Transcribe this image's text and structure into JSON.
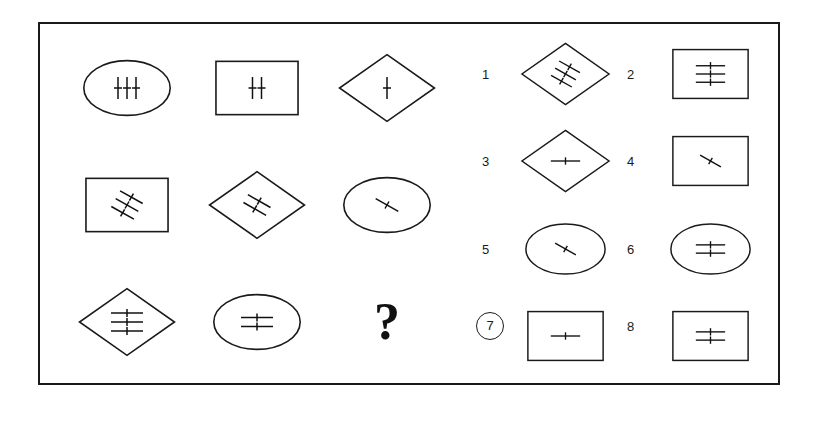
{
  "puzzle": {
    "title": "Matrix reasoning puzzle",
    "type": "3x3 matrix with 8 answer options",
    "question_mark": "?",
    "selected_option": "7",
    "frame_color": "#1a1a1a",
    "background_color": "#ffffff",
    "ink_color": "#111111"
  },
  "matrix": {
    "rows": 3,
    "cols": 3,
    "cells": [
      {
        "index": 1,
        "shape": "ellipse",
        "line_count": 3,
        "line_orientation": "vertical",
        "description": "ellipse with three vertical crossed lines"
      },
      {
        "index": 2,
        "shape": "rectangle",
        "line_count": 2,
        "line_orientation": "vertical",
        "description": "rectangle with two vertical crossed lines"
      },
      {
        "index": 3,
        "shape": "diamond",
        "line_count": 1,
        "line_orientation": "vertical",
        "description": "diamond with one vertical crossed line"
      },
      {
        "index": 4,
        "shape": "rectangle",
        "line_count": 3,
        "line_orientation": "diagonal",
        "description": "rectangle with three diagonal crossed lines"
      },
      {
        "index": 5,
        "shape": "diamond",
        "line_count": 2,
        "line_orientation": "diagonal",
        "description": "diamond with two diagonal crossed lines"
      },
      {
        "index": 6,
        "shape": "ellipse",
        "line_count": 1,
        "line_orientation": "diagonal",
        "description": "ellipse with one diagonal crossed line"
      },
      {
        "index": 7,
        "shape": "diamond",
        "line_count": 3,
        "line_orientation": "horizontal",
        "description": "diamond with three horizontal crossed lines"
      },
      {
        "index": 8,
        "shape": "ellipse",
        "line_count": 2,
        "line_orientation": "horizontal",
        "description": "ellipse with two horizontal crossed lines"
      },
      {
        "index": 9,
        "shape": "question",
        "line_count": 0,
        "line_orientation": "none",
        "description": "missing cell shown as a question mark"
      }
    ]
  },
  "options": {
    "count": 8,
    "items": [
      {
        "label": "1",
        "shape": "diamond",
        "line_count": 3,
        "line_orientation": "diagonal",
        "selected": false,
        "description": "diamond with three diagonal crossed lines"
      },
      {
        "label": "2",
        "shape": "rectangle",
        "line_count": 3,
        "line_orientation": "horizontal",
        "selected": false,
        "description": "rectangle with three horizontal crossed lines"
      },
      {
        "label": "3",
        "shape": "diamond",
        "line_count": 1,
        "line_orientation": "horizontal",
        "selected": false,
        "description": "diamond with one horizontal crossed line"
      },
      {
        "label": "4",
        "shape": "rectangle",
        "line_count": 1,
        "line_orientation": "diagonal",
        "selected": false,
        "description": "rectangle with one diagonal crossed line"
      },
      {
        "label": "5",
        "shape": "ellipse",
        "line_count": 1,
        "line_orientation": "diagonal",
        "selected": false,
        "description": "ellipse with one diagonal crossed line"
      },
      {
        "label": "6",
        "shape": "ellipse",
        "line_count": 2,
        "line_orientation": "horizontal",
        "selected": false,
        "description": "ellipse with two horizontal crossed lines"
      },
      {
        "label": "7",
        "shape": "rectangle",
        "line_count": 1,
        "line_orientation": "horizontal",
        "selected": true,
        "description": "rectangle with one horizontal crossed line"
      },
      {
        "label": "8",
        "shape": "rectangle",
        "line_count": 2,
        "line_orientation": "horizontal",
        "selected": false,
        "description": "rectangle with two horizontal crossed lines"
      }
    ]
  }
}
